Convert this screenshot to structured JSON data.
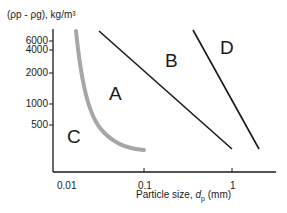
{
  "diagram": {
    "type": "Geldart particle classification",
    "y_axis": {
      "title": "(ρp - ρg),  kg/m³",
      "ticks": [
        "6000",
        "4000",
        "2000",
        "1000",
        "500"
      ]
    },
    "x_axis": {
      "title_prefix": "Particle size, ",
      "title_var": "d",
      "title_sub": "p",
      "title_suffix": " (mm)",
      "ticks": [
        "0.01",
        "0.1",
        "1"
      ]
    },
    "regions": [
      {
        "label": "A"
      },
      {
        "label": "B"
      },
      {
        "label": "C"
      },
      {
        "label": "D"
      }
    ],
    "boundaries": [
      {
        "name": "C-A boundary",
        "style": "gray curve",
        "color": "#a6a6a6"
      },
      {
        "name": "A-B boundary",
        "style": "black line",
        "color": "#1a1a1a"
      },
      {
        "name": "B-D boundary",
        "style": "black line",
        "color": "#1a1a1a"
      }
    ]
  }
}
